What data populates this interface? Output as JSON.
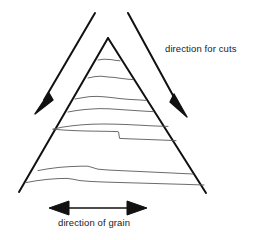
{
  "figure": {
    "title": "",
    "background_color": "#ffffff",
    "width": 257,
    "height": 240,
    "stroke_color_heavy": "#111111",
    "stroke_color_light": "#555555",
    "labels": {
      "cuts": "direction for cuts",
      "grain": "direction of grain"
    },
    "annotations": [
      {
        "name": "cut-arrow-left",
        "kind": "arrow",
        "direction": "down-left",
        "from": [
          95,
          13
        ],
        "to": [
          37,
          112
        ]
      },
      {
        "name": "cut-arrow-right",
        "kind": "arrow",
        "direction": "down-right",
        "from": [
          128,
          13
        ],
        "to": [
          186,
          116
        ]
      },
      {
        "name": "grain-arrow",
        "kind": "double-arrow",
        "direction": "horizontal",
        "from": [
          50,
          208
        ],
        "to": [
          146,
          208
        ]
      }
    ],
    "workpiece": {
      "name": "triangle-workpiece",
      "shape": "triangle",
      "apex": [
        108,
        38
      ],
      "base_left": [
        19,
        192
      ],
      "base_right": [
        206,
        193
      ],
      "grain_line_count": 8
    }
  }
}
